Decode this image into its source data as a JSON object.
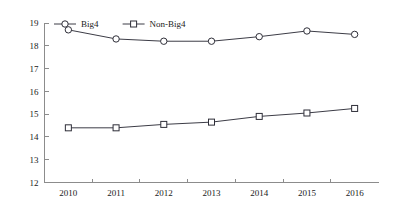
{
  "chart_data": {
    "type": "line",
    "title": "",
    "subtitle": "",
    "xlabel": "",
    "ylabel": "",
    "categories": [
      "2010",
      "2011",
      "2012",
      "2013",
      "2014",
      "2015",
      "2016"
    ],
    "x": [
      2010,
      2011,
      2012,
      2013,
      2014,
      2015,
      2016
    ],
    "series": [
      {
        "name": "Big4",
        "marker": "circle-open",
        "color": "#2e2e38",
        "values": [
          18.7,
          18.3,
          18.2,
          18.2,
          18.4,
          18.65,
          18.5
        ]
      },
      {
        "name": "Non-Big4",
        "marker": "square-open",
        "color": "#2e2e38",
        "values": [
          14.4,
          14.4,
          14.55,
          14.65,
          14.9,
          15.05,
          15.25
        ]
      }
    ],
    "ylim": [
      12,
      19
    ],
    "yticks": [
      12,
      13,
      14,
      15,
      16,
      17,
      18,
      19
    ],
    "ytick_labels": [
      "12",
      "13",
      "14",
      "15",
      "16",
      "17",
      "18",
      "19"
    ],
    "xtick_labels": [
      "2010",
      "2011",
      "2012",
      "2013",
      "2014",
      "2015",
      "2016"
    ],
    "grid": false,
    "legend_position": "top-left",
    "legend_entries": [
      "Big4",
      "Non-Big4"
    ],
    "axis_color": "#8c8c8c",
    "background": "#ffffff"
  }
}
